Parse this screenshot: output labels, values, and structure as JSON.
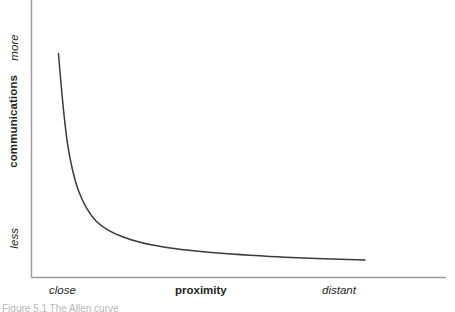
{
  "figure": {
    "background_color": "#ffffff",
    "axis_color": "#9a9a9a",
    "curve_color": "#3a3a3a"
  },
  "axes": {
    "y": {
      "title": "communications",
      "top_label": "more",
      "bottom_label": "less"
    },
    "x": {
      "title": "proximity",
      "left_label": "close",
      "right_label": "distant"
    }
  },
  "caption": {
    "text": "Figure 5.1  The Allen curve"
  },
  "chart_data": {
    "type": "line",
    "title": "",
    "subtitle": "",
    "xlabel": "proximity",
    "ylabel": "communications",
    "xlim": [
      0,
      1
    ],
    "ylim": [
      0,
      1
    ],
    "grid": false,
    "legend": null,
    "x_tick_labels": [
      "close",
      "distant"
    ],
    "y_tick_labels": [
      "less",
      "more"
    ],
    "annotations": [],
    "series": [
      {
        "name": "communication frequency vs distance",
        "description": "Steeply decaying hyperbolic curve: communication drops off sharply as proximity decreases, then flattens to a low asymptote.",
        "x": [
          0.042,
          0.05,
          0.06,
          0.072,
          0.087,
          0.105,
          0.13,
          0.16,
          0.196,
          0.24,
          0.3,
          0.37,
          0.45,
          0.54,
          0.64,
          0.75,
          0.87,
          1.0
        ],
        "y": [
          0.807,
          0.7,
          0.58,
          0.47,
          0.383,
          0.312,
          0.25,
          0.203,
          0.172,
          0.148,
          0.126,
          0.11,
          0.098,
          0.088,
          0.08,
          0.073,
          0.068,
          0.063
        ]
      }
    ]
  }
}
